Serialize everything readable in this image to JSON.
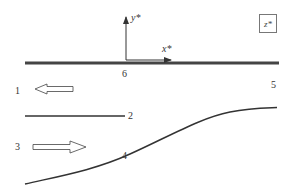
{
  "diagram": {
    "axes": {
      "x_label": "x*",
      "y_label": "y*",
      "z_label": "z*"
    },
    "points": [
      {
        "id": "1",
        "label": "1"
      },
      {
        "id": "2",
        "label": "2"
      },
      {
        "id": "3",
        "label": "3"
      },
      {
        "id": "4",
        "label": "4"
      },
      {
        "id": "5",
        "label": "5"
      },
      {
        "id": "6",
        "label": "6"
      }
    ],
    "colors": {
      "line": "#333333",
      "thick_line": "#444444",
      "text": "#333333"
    }
  }
}
